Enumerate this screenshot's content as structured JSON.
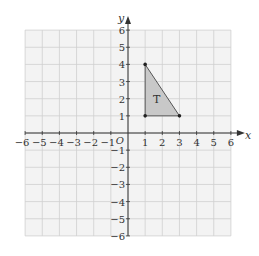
{
  "chart_data": {
    "type": "diagram",
    "title": "",
    "xlabel": "x",
    "ylabel": "y",
    "origin_label": "O",
    "xlim": [
      -6,
      6
    ],
    "ylim": [
      -6,
      6
    ],
    "grid": true,
    "x_ticks": [
      "-6",
      "-5",
      "-4",
      "-3",
      "-2",
      "-1",
      "1",
      "2",
      "3",
      "4",
      "5",
      "6"
    ],
    "y_ticks": [
      "6",
      "5",
      "4",
      "3",
      "2",
      "1",
      "-1",
      "-2",
      "-3",
      "-4",
      "-5",
      "-6"
    ],
    "shapes": [
      {
        "label": "T",
        "kind": "triangle",
        "vertices": [
          [
            1,
            4
          ],
          [
            1,
            1
          ],
          [
            3,
            1
          ]
        ],
        "fill": "#c8c8c8",
        "stroke": "#555555"
      }
    ]
  },
  "colors": {
    "grid_bg": "#f3f3f3",
    "grid_line": "#cfcfcf",
    "axis": "#333333",
    "text": "#333333"
  }
}
